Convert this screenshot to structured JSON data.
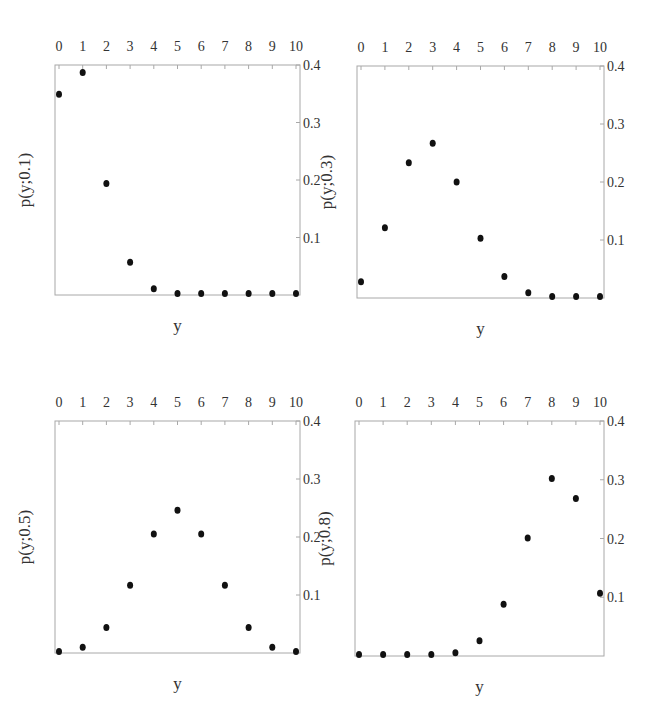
{
  "chart_data": [
    {
      "type": "scatter",
      "panel": "top-left",
      "title": "",
      "xlabel": "y",
      "ylabel": "p(y;0.1)",
      "x": [
        0,
        1,
        2,
        3,
        4,
        5,
        6,
        7,
        8,
        9,
        10
      ],
      "values": [
        0.349,
        0.387,
        0.194,
        0.057,
        0.011,
        0.0015,
        0.0001,
        0.0,
        0.0,
        0.0,
        0.0
      ],
      "xticks": [
        "0",
        "1",
        "2",
        "3",
        "4",
        "5",
        "6",
        "7",
        "8",
        "9",
        "10"
      ],
      "yticks": [
        "0.1",
        "0.2",
        "0.3",
        "0.4"
      ],
      "xlim": [
        0,
        10
      ],
      "ylim": [
        0,
        0.4
      ],
      "x_axis_position": "top",
      "y_axis_position": "right",
      "grid": false
    },
    {
      "type": "scatter",
      "panel": "top-right",
      "title": "",
      "xlabel": "y",
      "ylabel": "p(y;0.3)",
      "x": [
        0,
        1,
        2,
        3,
        4,
        5,
        6,
        7,
        8,
        9,
        10
      ],
      "values": [
        0.028,
        0.121,
        0.233,
        0.267,
        0.2,
        0.103,
        0.037,
        0.009,
        0.0014,
        0.0001,
        0.0
      ],
      "xticks": [
        "0",
        "1",
        "2",
        "3",
        "4",
        "5",
        "6",
        "7",
        "8",
        "9",
        "10"
      ],
      "yticks": [
        "0.1",
        "0.2",
        "0.3",
        "0.4"
      ],
      "xlim": [
        0,
        10
      ],
      "ylim": [
        0,
        0.4
      ],
      "x_axis_position": "top",
      "y_axis_position": "right",
      "grid": false
    },
    {
      "type": "scatter",
      "panel": "bottom-left",
      "title": "",
      "xlabel": "y",
      "ylabel": "p(y;0.5)",
      "x": [
        0,
        1,
        2,
        3,
        4,
        5,
        6,
        7,
        8,
        9,
        10
      ],
      "values": [
        0.001,
        0.01,
        0.044,
        0.117,
        0.205,
        0.246,
        0.205,
        0.117,
        0.044,
        0.01,
        0.001
      ],
      "xticks": [
        "0",
        "1",
        "2",
        "3",
        "4",
        "5",
        "6",
        "7",
        "8",
        "9",
        "10"
      ],
      "yticks": [
        "0.1",
        "0.2",
        "0.3",
        "0.4"
      ],
      "xlim": [
        0,
        10
      ],
      "ylim": [
        0,
        0.4
      ],
      "x_axis_position": "top",
      "y_axis_position": "right",
      "grid": false
    },
    {
      "type": "scatter",
      "panel": "bottom-right",
      "title": "",
      "xlabel": "y",
      "ylabel": "p(y;0.8)",
      "x": [
        0,
        1,
        2,
        3,
        4,
        5,
        6,
        7,
        8,
        9,
        10
      ],
      "values": [
        0.0,
        0.0,
        0.0001,
        0.0008,
        0.0055,
        0.026,
        0.088,
        0.201,
        0.302,
        0.268,
        0.107
      ],
      "xticks": [
        "0",
        "1",
        "2",
        "3",
        "4",
        "5",
        "6",
        "7",
        "8",
        "9",
        "10"
      ],
      "yticks": [
        "0.1",
        "0.2",
        "0.3",
        "0.4"
      ],
      "xlim": [
        0,
        10
      ],
      "ylim": [
        0,
        0.4
      ],
      "x_axis_position": "top",
      "y_axis_position": "right",
      "grid": false
    }
  ],
  "colors": {
    "frame": "#a8a8a8",
    "marker": "#111111",
    "text": "#333333",
    "background": "#ffffff"
  }
}
